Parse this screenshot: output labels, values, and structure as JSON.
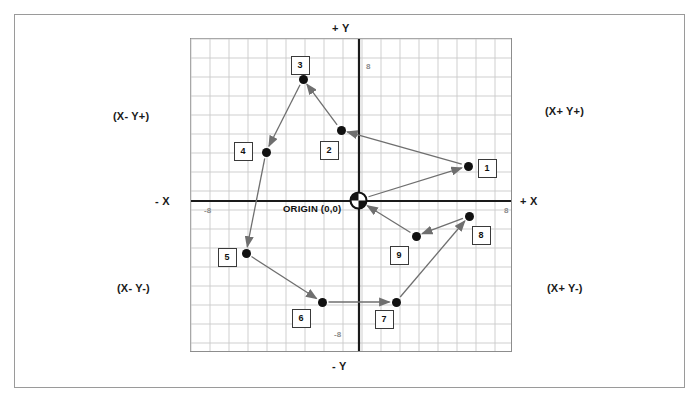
{
  "diagram": {
    "origin_label": "ORIGIN (0,0)",
    "axis_labels": {
      "y_positive": "+ Y",
      "y_negative": "- Y",
      "x_positive": "+ X",
      "x_negative": "- X"
    },
    "quadrants": [
      {
        "name": "quadrant-1",
        "label": "(X+ Y+)"
      },
      {
        "name": "quadrant-2",
        "label": "(X- Y+)"
      },
      {
        "name": "quadrant-3",
        "label": "(X- Y-)"
      },
      {
        "name": "quadrant-4",
        "label": "(X+ Y-)"
      }
    ],
    "ticks": [
      {
        "name": "x-positive-tick",
        "label": "8"
      },
      {
        "name": "x-negative-tick",
        "label": "-8"
      },
      {
        "name": "y-positive-tick",
        "label": "8"
      },
      {
        "name": "y-negative-tick",
        "label": "-8"
      }
    ],
    "colors": {
      "grid_line": "#c9c9c9",
      "axis_line": "#1a1a1a",
      "point_fill": "#111111",
      "box_border": "#3a3a3a",
      "arrow": "#6f6f6f",
      "frame": "#9a9a9a"
    }
  },
  "chart_data": {
    "type": "scatter",
    "xlabel": "+ X",
    "ylabel": "+ Y",
    "xlim": [
      -9,
      8
    ],
    "ylim": [
      -8,
      8.5
    ],
    "grid": true,
    "legend": "none",
    "origin": {
      "x": 0,
      "y": 0,
      "label": "ORIGIN (0,0)"
    },
    "xticks": [
      -8,
      8
    ],
    "yticks": [
      -8,
      8
    ],
    "points": [
      {
        "id": "1",
        "x": 6,
        "y": 2,
        "px": 468,
        "py": 166,
        "box_px": 487,
        "box_py": 168
      },
      {
        "id": "2",
        "x": 1,
        "y": 3,
        "px": 341,
        "py": 130,
        "box_px": 329,
        "box_py": 150
      },
      {
        "id": "3",
        "x": -1,
        "y": 6,
        "px": 303,
        "py": 79,
        "box_px": 300,
        "box_py": 65
      },
      {
        "id": "4",
        "x": -5,
        "y": 2,
        "px": 266,
        "py": 152,
        "box_px": 243,
        "box_py": 151
      },
      {
        "id": "5",
        "x": -7,
        "y": -3,
        "px": 246,
        "py": 253,
        "box_px": 227,
        "box_py": 257
      },
      {
        "id": "6",
        "x": -2,
        "y": -6,
        "px": 322,
        "py": 302,
        "box_px": 301,
        "box_py": 318
      },
      {
        "id": "7",
        "x": 2,
        "y": -6,
        "px": 396,
        "py": 302,
        "box_px": 384,
        "box_py": 319
      },
      {
        "id": "8",
        "x": 6,
        "y": -1,
        "px": 469,
        "py": 216,
        "box_px": 481,
        "box_py": 235
      },
      {
        "id": "9",
        "x": 3,
        "y": -2,
        "px": 416,
        "py": 236,
        "box_px": 399,
        "box_py": 255
      }
    ],
    "connections": [
      {
        "from": "1",
        "to": "2"
      },
      {
        "from": "2",
        "to": "3"
      },
      {
        "from": "3",
        "to": "4"
      },
      {
        "from": "4",
        "to": "5"
      },
      {
        "from": "5",
        "to": "6"
      },
      {
        "from": "6",
        "to": "7"
      },
      {
        "from": "7",
        "to": "8"
      },
      {
        "from": "8",
        "to": "9"
      },
      {
        "from": "9",
        "to": "origin"
      },
      {
        "from": "origin",
        "to": "1"
      }
    ]
  }
}
